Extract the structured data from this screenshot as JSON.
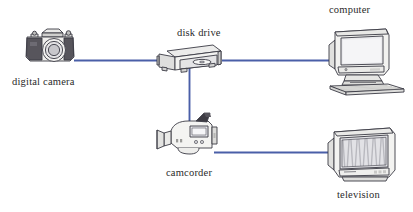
{
  "diagram": {
    "background_color": "#ffffff",
    "wire_color": "#4a5fa8",
    "outline_color": "#3a3a44",
    "body_fill": "#f4f4f2",
    "shade_fill": "#d8d8d6",
    "screen_fill": "#e8e8ea",
    "nodes": [
      {
        "id": "digital-camera",
        "label": "digital camera",
        "icon": "slr-camera-icon",
        "label_x": 12,
        "label_y": 76,
        "icon_x": 22,
        "icon_y": 27
      },
      {
        "id": "disk-drive",
        "label": "disk drive",
        "icon": "disk-drive-icon",
        "label_x": 177,
        "label_y": 27,
        "icon_x": 157,
        "icon_y": 43
      },
      {
        "id": "computer",
        "label": "computer",
        "icon": "crt-computer-icon",
        "label_x": 329,
        "label_y": 4,
        "icon_x": 326,
        "icon_y": 23
      },
      {
        "id": "camcorder",
        "label": "camcorder",
        "icon": "camcorder-icon",
        "label_x": 166,
        "label_y": 167,
        "icon_x": 156,
        "icon_y": 118
      },
      {
        "id": "television",
        "label": "television",
        "icon": "crt-television-icon",
        "label_x": 337,
        "label_y": 189,
        "icon_x": 326,
        "icon_y": 126
      }
    ],
    "connections": [
      {
        "id": "camera-to-drive",
        "from": "digital-camera",
        "to": "disk-drive",
        "orientation": "horizontal"
      },
      {
        "id": "drive-to-computer",
        "from": "disk-drive",
        "to": "computer",
        "orientation": "horizontal"
      },
      {
        "id": "drive-to-camcorder",
        "from": "disk-drive",
        "to": "camcorder",
        "orientation": "vertical"
      },
      {
        "id": "camcorder-to-tv",
        "from": "camcorder",
        "to": "television",
        "orientation": "horizontal"
      }
    ]
  }
}
